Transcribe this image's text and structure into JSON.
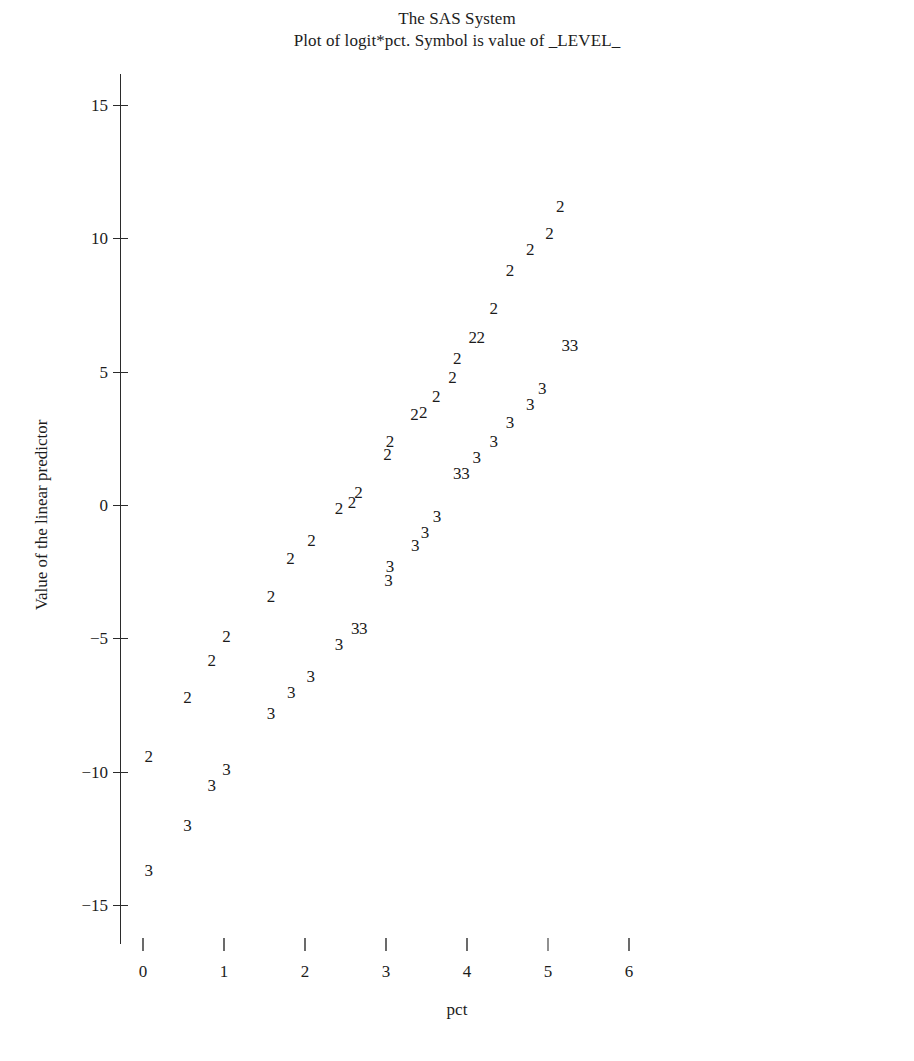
{
  "title": {
    "line1": "The SAS System",
    "line2": "Plot of logit*pct. Symbol is value of _LEVEL_"
  },
  "axes": {
    "xlabel": "pct",
    "ylabel": "Value of the linear predictor",
    "x_ticks": [
      "0",
      "1",
      "2",
      "3",
      "4",
      "5",
      "6"
    ],
    "y_ticks": [
      "15",
      "10",
      "5",
      "0",
      "−5",
      "−10",
      "−15"
    ]
  },
  "chart_data": {
    "type": "scatter",
    "title": "Plot of logit*pct. Symbol is value of _LEVEL_",
    "supertitle": "The SAS System",
    "xlabel": "pct",
    "ylabel": "Value of the linear predictor",
    "xlim": [
      0,
      6
    ],
    "ylim": [
      -15,
      15
    ],
    "x_ticks": [
      0,
      1,
      2,
      3,
      4,
      5,
      6
    ],
    "y_ticks": [
      -15,
      -10,
      -5,
      0,
      5,
      10,
      15
    ],
    "grid": false,
    "legend": "none",
    "symbol_note": "Symbol character is the value of _LEVEL_",
    "series": [
      {
        "name": "_LEVEL_ = 2",
        "symbol": "2",
        "points": [
          {
            "x": 0.07,
            "y": -9.4
          },
          {
            "x": 0.55,
            "y": -7.2
          },
          {
            "x": 0.85,
            "y": -5.8
          },
          {
            "x": 1.03,
            "y": -4.9
          },
          {
            "x": 1.58,
            "y": -3.4
          },
          {
            "x": 1.82,
            "y": -2.0
          },
          {
            "x": 2.08,
            "y": -1.3
          },
          {
            "x": 2.42,
            "y": -0.1
          },
          {
            "x": 2.58,
            "y": 0.1
          },
          {
            "x": 2.66,
            "y": 0.5
          },
          {
            "x": 3.02,
            "y": 1.9
          },
          {
            "x": 3.05,
            "y": 2.4
          },
          {
            "x": 3.35,
            "y": 3.4
          },
          {
            "x": 3.46,
            "y": 3.5
          },
          {
            "x": 3.62,
            "y": 4.1
          },
          {
            "x": 3.82,
            "y": 4.8
          },
          {
            "x": 3.88,
            "y": 5.5
          },
          {
            "x": 4.07,
            "y": 6.3
          },
          {
            "x": 4.17,
            "y": 6.3
          },
          {
            "x": 4.33,
            "y": 7.4
          },
          {
            "x": 4.53,
            "y": 8.8
          },
          {
            "x": 4.78,
            "y": 9.6
          },
          {
            "x": 5.02,
            "y": 10.2
          },
          {
            "x": 5.15,
            "y": 11.2
          }
        ]
      },
      {
        "name": "_LEVEL_ = 3",
        "symbol": "3",
        "points": [
          {
            "x": 0.07,
            "y": -13.7
          },
          {
            "x": 0.55,
            "y": -12.0
          },
          {
            "x": 0.85,
            "y": -10.5
          },
          {
            "x": 1.03,
            "y": -9.9
          },
          {
            "x": 1.58,
            "y": -7.8
          },
          {
            "x": 1.83,
            "y": -7.0
          },
          {
            "x": 2.07,
            "y": -6.4
          },
          {
            "x": 2.42,
            "y": -5.2
          },
          {
            "x": 2.62,
            "y": -4.6
          },
          {
            "x": 2.72,
            "y": -4.6
          },
          {
            "x": 3.03,
            "y": -2.8
          },
          {
            "x": 3.05,
            "y": -2.3
          },
          {
            "x": 3.36,
            "y": -1.5
          },
          {
            "x": 3.48,
            "y": -1.0
          },
          {
            "x": 3.63,
            "y": -0.4
          },
          {
            "x": 3.88,
            "y": 1.2
          },
          {
            "x": 3.98,
            "y": 1.2
          },
          {
            "x": 4.12,
            "y": 1.8
          },
          {
            "x": 4.33,
            "y": 2.4
          },
          {
            "x": 4.53,
            "y": 3.1
          },
          {
            "x": 4.78,
            "y": 3.8
          },
          {
            "x": 4.93,
            "y": 4.4
          },
          {
            "x": 5.22,
            "y": 6.0
          },
          {
            "x": 5.32,
            "y": 6.0
          }
        ]
      }
    ]
  }
}
